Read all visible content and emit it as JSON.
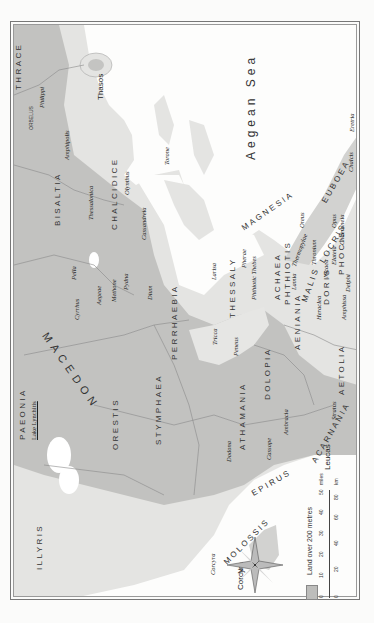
{
  "map": {
    "orientation": "rotated-90-ccw",
    "colors": {
      "land_low": "#e6e6e4",
      "land_high": "#bdbdbb",
      "sea": "#fdfdfc",
      "border": "#8a8a8a",
      "lake": "#ffffff"
    },
    "sea_labels": [
      {
        "name": "Aegean Sea"
      }
    ],
    "island_labels": [
      {
        "name": "Thasos"
      },
      {
        "name": "Corcyra"
      },
      {
        "name": "Leucas"
      }
    ],
    "regions": {
      "thrace": "THRACE",
      "bisaltia": "BISALTIA",
      "chalcidice": "CHALCIDICE",
      "paeonia": "PAEONIA",
      "macedon": "MACEDON",
      "orestis": "ORESTIS",
      "stymphaea": "STYMPHAEA",
      "perrhaebia": "PERRHAEBIA",
      "magnesia": "MAGNESIA",
      "thessaly": "THESSALY",
      "achaea_phthiotis_1": "ACHAEA",
      "achaea_phthiotis_2": "PHTHIOTIS",
      "aenianians": "AENIANIA",
      "dolopia": "DOLOPIA",
      "athamania": "ATHAMANIA",
      "molossis": "MOLOSSIS",
      "epirus": "EPIRUS",
      "illyris": "ILLYRIS",
      "aetolia": "AETOLIA",
      "acarnania": "ACARNANIA",
      "malis": "MALIS",
      "locris": "LOCRIS",
      "doris": "DORIS",
      "phocis": "PHOCIS",
      "euboea": "EUBOEA"
    },
    "lakes": [
      {
        "name": "Lake Lynchitis"
      }
    ],
    "mountains": [
      {
        "name": "ORBELUS"
      }
    ],
    "cities": {
      "philippi": "Philippi",
      "amphipolis": "Amphipolis",
      "thessalonica": "Thessalonica",
      "olynthus": "Olynthus",
      "torone": "Torone",
      "cassandreia": "Cassandreia",
      "pella": "Pella",
      "cyrrhus": "Cyrrhus",
      "aegeae": "Aegeae",
      "methone": "Methone",
      "pydna": "Pydna",
      "dium": "Dium",
      "larisa": "Larisa",
      "pherae": "Pherae",
      "phthiotic_thebes": "Phthiotic Thebes",
      "tricca": "Tricca",
      "peneus": "Peneus",
      "lamia": "Lamia",
      "thermopylae": "Thermopylae",
      "heraclea": "Heraclea",
      "nicaea": "Nicaea",
      "thronium": "Thronium",
      "elateia": "Elateia",
      "opus": "Opus",
      "chaeroneia": "Chaeroneia",
      "delphi": "Delphi",
      "amphissa": "Amphissa",
      "oreus": "Oreus",
      "chalcis": "Chalcis",
      "eretria": "Eretria",
      "stratus": "Stratus",
      "ambracia": "Ambracia",
      "cassope": "Cassope",
      "dodona": "Dodona",
      "corcyra_city": "Corcyra"
    },
    "compass": {
      "north_label": "N"
    },
    "legend": {
      "land_label": "Land over 200 metres"
    },
    "scale": {
      "miles_label": "miles",
      "km_label": "km",
      "miles_ticks": [
        "0",
        "10",
        "20",
        "30",
        "40",
        "50"
      ],
      "km_ticks": [
        "0",
        "20",
        "40",
        "60",
        "80"
      ]
    }
  }
}
